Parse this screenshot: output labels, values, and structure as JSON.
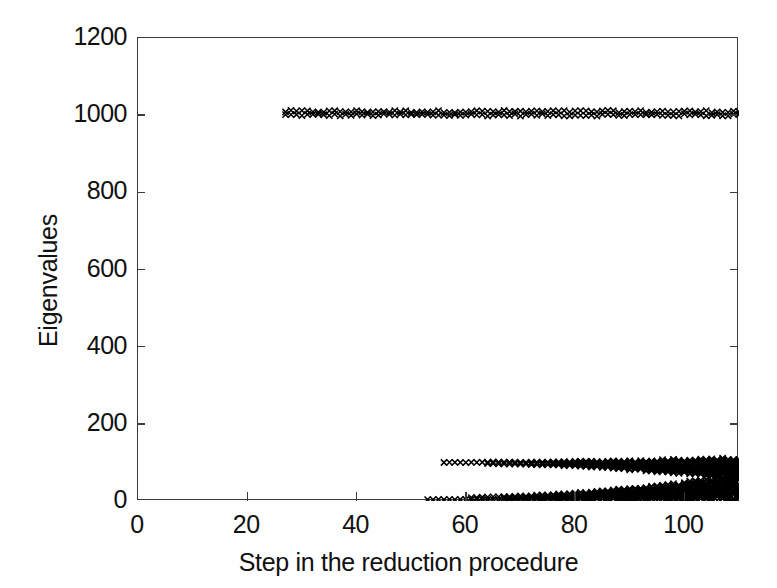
{
  "chart_data": {
    "type": "scatter",
    "title": "",
    "xlabel": "Step in the reduction procedure",
    "ylabel": "Eigenvalues",
    "xlim": [
      0,
      110
    ],
    "ylim": [
      0,
      1200
    ],
    "xticks": [
      0,
      20,
      40,
      60,
      80,
      100
    ],
    "yticks": [
      0,
      200,
      400,
      600,
      800,
      1000,
      1200
    ],
    "grid": false,
    "legend": null,
    "marker": "x",
    "marker_color": "#000000",
    "series": [
      {
        "name": "upper-eigenvalue-branch",
        "comment": "Dense row of x markers at eigenvalue ~1000, from step 27 to step 110",
        "x_start": 27,
        "x_end": 110,
        "y_value": 1005,
        "y_spread": 8,
        "spread_grows": false
      },
      {
        "name": "middle-eigenvalue-branch",
        "comment": "Dense row of x markers at eigenvalue ~100, from step 56 to step 110, fanning out toward the right",
        "x_start": 56,
        "x_end": 110,
        "y_value": 100,
        "y_spread": 4,
        "spread_grows": true,
        "spread_max": 70
      },
      {
        "name": "lower-eigenvalue-branch",
        "comment": "Dense row of x markers at eigenvalue ~0, from step 53 to step 110, fanning upward toward the right",
        "x_start": 53,
        "x_end": 110,
        "y_value": 4,
        "y_spread": 4,
        "spread_grows": true,
        "spread_max": 60
      }
    ]
  },
  "axes": {
    "x_tick_labels": [
      "0",
      "20",
      "40",
      "60",
      "80",
      "100"
    ],
    "y_tick_labels": [
      "0",
      "200",
      "400",
      "600",
      "800",
      "1000",
      "1200"
    ],
    "x_axis_title": "Step in the reduction procedure",
    "y_axis_title": "Eigenvalues"
  }
}
